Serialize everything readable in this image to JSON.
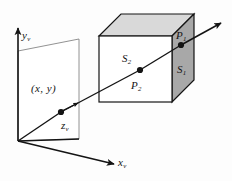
{
  "figure": {
    "background_color": "#fdfdfd",
    "line_color": "#141414",
    "labels": {
      "y_axis": {
        "base": "y",
        "sub": "v"
      },
      "x_axis": {
        "base": "x",
        "sub": "v"
      },
      "z_axis": {
        "base": "z",
        "sub": "v"
      },
      "pixel_coord": "(x,  y)",
      "surface_front": {
        "base": "S",
        "sub": "2"
      },
      "surface_right": {
        "base": "S",
        "sub": "1"
      },
      "point_front": {
        "base": "P",
        "sub": "2"
      },
      "point_right": {
        "base": "P",
        "sub": "1"
      }
    },
    "cube": {
      "front_face_color": "#ffffff",
      "top_face_color": "#d9d9d9",
      "right_face_color": "#a8a8a8"
    },
    "view_plane": {
      "fill_color": "#ffffff",
      "edge_color": "#141414"
    }
  }
}
